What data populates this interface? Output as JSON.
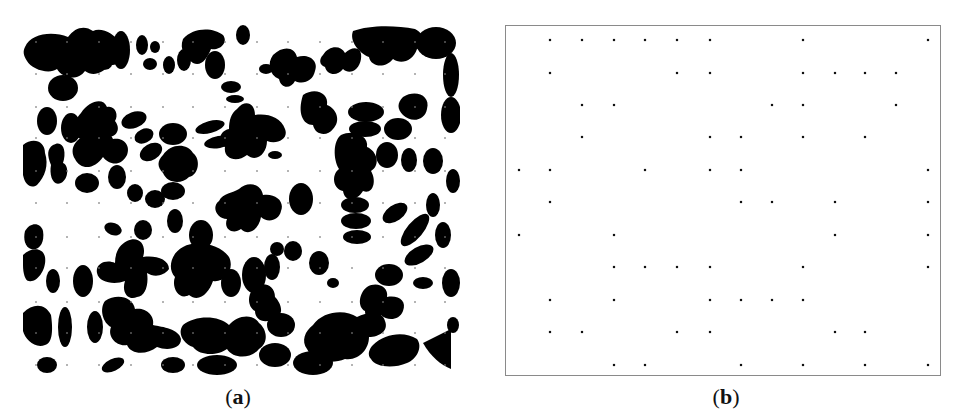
{
  "figure": {
    "panels": [
      {
        "id": "a",
        "caption_open": "(",
        "caption_letter": "a",
        "caption_close": ")",
        "description": "binary microstructure image with overlaid sampling grid"
      },
      {
        "id": "b",
        "caption_open": "(",
        "caption_letter": "b",
        "caption_close": ")",
        "description": "sampled grid points shown as dots inside bounding box"
      }
    ],
    "grid": {
      "columns": 14,
      "rows": 11,
      "panel_a": {
        "x": [
          13,
          44,
          76,
          108,
          140,
          170,
          202,
          234,
          265,
          297,
          329,
          360,
          392,
          422
        ],
        "y": [
          17,
          49,
          82,
          113,
          146,
          178,
          212,
          243,
          277,
          308,
          340
        ],
        "dot_color": "#7a7a7a"
      },
      "panel_b": {
        "x": [
          13,
          44,
          76,
          108,
          139,
          171,
          204,
          235,
          266,
          297,
          329,
          359,
          390,
          422
        ],
        "y": [
          14,
          47,
          79,
          111,
          144,
          176,
          209,
          241,
          274,
          306,
          339
        ],
        "dot_color": "#111111"
      }
    },
    "panel_b_points": [
      [
        0,
        1,
        1,
        1,
        1,
        1,
        1,
        0,
        0,
        1,
        0,
        0,
        0,
        1
      ],
      [
        0,
        1,
        0,
        0,
        0,
        1,
        1,
        0,
        0,
        1,
        1,
        1,
        1,
        0
      ],
      [
        0,
        0,
        1,
        1,
        0,
        0,
        0,
        0,
        1,
        1,
        0,
        0,
        1,
        0
      ],
      [
        0,
        0,
        1,
        0,
        0,
        0,
        1,
        1,
        0,
        1,
        0,
        1,
        0,
        0
      ],
      [
        1,
        1,
        0,
        0,
        1,
        0,
        1,
        1,
        0,
        0,
        0,
        0,
        0,
        1
      ],
      [
        0,
        1,
        0,
        0,
        0,
        0,
        0,
        1,
        1,
        0,
        1,
        0,
        0,
        1
      ],
      [
        1,
        0,
        0,
        1,
        0,
        0,
        0,
        0,
        0,
        0,
        1,
        0,
        0,
        1
      ],
      [
        0,
        0,
        0,
        1,
        1,
        1,
        1,
        0,
        0,
        1,
        0,
        0,
        0,
        1
      ],
      [
        0,
        1,
        0,
        1,
        0,
        0,
        1,
        1,
        1,
        1,
        0,
        0,
        0,
        0
      ],
      [
        0,
        1,
        1,
        0,
        0,
        1,
        1,
        0,
        0,
        0,
        1,
        1,
        0,
        0
      ],
      [
        0,
        0,
        0,
        1,
        1,
        0,
        0,
        1,
        0,
        1,
        0,
        1,
        0,
        1
      ]
    ],
    "colors": {
      "background": "#ffffff",
      "phase_black": "#000000",
      "box_border": "#8a8a8a"
    }
  }
}
